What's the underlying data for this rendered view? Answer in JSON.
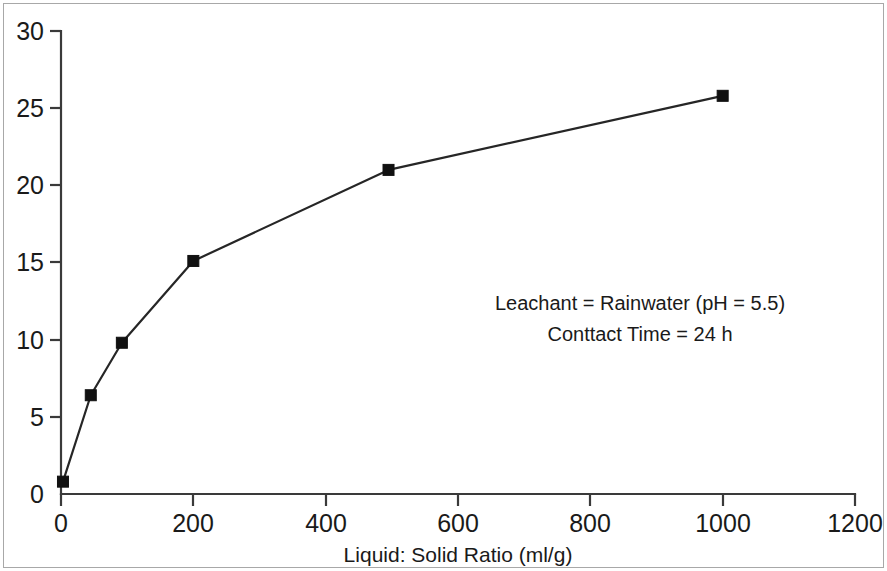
{
  "chart_data": {
    "type": "line",
    "title": "",
    "xlabel": "Liquid: Solid Ratio (ml/g)",
    "ylabel": "",
    "xlim": [
      0,
      1200
    ],
    "ylim": [
      0,
      30
    ],
    "xticks": [
      0,
      200,
      400,
      600,
      800,
      1000,
      1200
    ],
    "yticks": [
      0,
      5,
      10,
      15,
      20,
      25,
      30
    ],
    "xtick_labels": [
      "0",
      "200",
      "400",
      "600",
      "800",
      "1000",
      "1200"
    ],
    "ytick_labels": [
      "0",
      "5",
      "10",
      "15",
      "20",
      "25",
      "30"
    ],
    "grid": false,
    "legend": null,
    "marker": "square",
    "series": [
      {
        "name": "Leaching vs Liquid:Solid Ratio",
        "x": [
          3,
          45,
          92,
          200,
          495,
          1000
        ],
        "y": [
          0.8,
          6.4,
          9.8,
          15.1,
          21.0,
          25.8
        ]
      }
    ],
    "annotations": [
      "Leachant = Rainwater (pH = 5.5)",
      "Conttact Time = 24 h"
    ],
    "colors": {
      "line": "#262626",
      "marker": "#111111",
      "axis": "#3a3a3a",
      "text": "#1a1a1a",
      "frame": "#a8a8a8",
      "background": "#ffffff"
    }
  },
  "annotation_block": {
    "line1": "Leachant = Rainwater (pH = 5.5)",
    "line2": "Conttact Time = 24 h"
  },
  "axes": {
    "x_title": "Liquid: Solid Ratio (ml/g)"
  }
}
